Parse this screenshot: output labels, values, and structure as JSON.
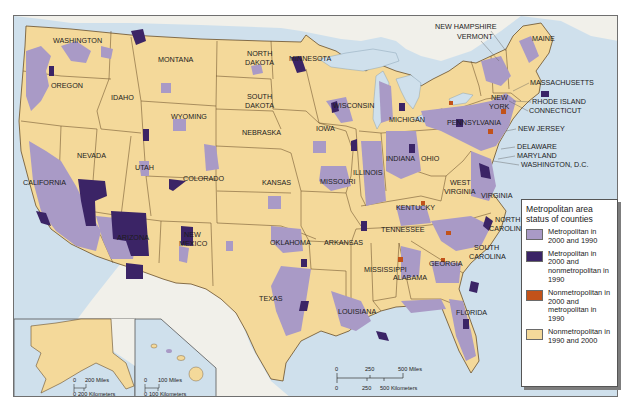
{
  "map": {
    "title": "Metropolitan area status of counties, United States, 1990 and 2000",
    "colors": {
      "water": "#cfe0ec",
      "foreign_land": "#f1f0ea",
      "nonmetro": "#f4d99a",
      "metro_both": "#a99ac6",
      "metro_new": "#3b2466",
      "nonmetro_new": "#c2521a",
      "border": "#6a4f2a"
    },
    "state_labels": [
      {
        "name": "WASHINGTON",
        "x": 52,
        "y": 42
      },
      {
        "name": "OREGON",
        "x": 50,
        "y": 87
      },
      {
        "name": "CALIFORNIA",
        "x": 22,
        "y": 184
      },
      {
        "name": "NEVADA",
        "x": 76,
        "y": 157
      },
      {
        "name": "IDAHO",
        "x": 110,
        "y": 99
      },
      {
        "name": "MONTANA",
        "x": 157,
        "y": 61
      },
      {
        "name": "WYOMING",
        "x": 170,
        "y": 118
      },
      {
        "name": "UTAH",
        "x": 134,
        "y": 169
      },
      {
        "name": "COLORADO",
        "x": 182,
        "y": 180
      },
      {
        "name": "ARIZONA",
        "x": 116,
        "y": 239
      },
      {
        "name": "NEW",
        "x": 183,
        "y": 236
      },
      {
        "name": "MEXICO",
        "x": 178,
        "y": 245
      },
      {
        "name": "NORTH",
        "x": 246,
        "y": 55
      },
      {
        "name": "DAKOTA",
        "x": 244,
        "y": 64
      },
      {
        "name": "SOUTH",
        "x": 246,
        "y": 98
      },
      {
        "name": "DAKOTA",
        "x": 244,
        "y": 107
      },
      {
        "name": "NEBRASKA",
        "x": 241,
        "y": 134
      },
      {
        "name": "KANSAS",
        "x": 261,
        "y": 184
      },
      {
        "name": "OKLAHOMA",
        "x": 269,
        "y": 244
      },
      {
        "name": "TEXAS",
        "x": 258,
        "y": 300
      },
      {
        "name": "MINNESOTA",
        "x": 288,
        "y": 60
      },
      {
        "name": "IOWA",
        "x": 315,
        "y": 130
      },
      {
        "name": "MISSOURI",
        "x": 319,
        "y": 183
      },
      {
        "name": "ARKANSAS",
        "x": 323,
        "y": 244
      },
      {
        "name": "LOUISIANA",
        "x": 337,
        "y": 313
      },
      {
        "name": "WISCONSIN",
        "x": 332,
        "y": 107
      },
      {
        "name": "ILLINOIS",
        "x": 352,
        "y": 174
      },
      {
        "name": "MICHIGAN",
        "x": 388,
        "y": 121
      },
      {
        "name": "INDIANA",
        "x": 385,
        "y": 160
      },
      {
        "name": "OHIO",
        "x": 420,
        "y": 160
      },
      {
        "name": "KENTUCKY",
        "x": 395,
        "y": 209
      },
      {
        "name": "TENNESSEE",
        "x": 380,
        "y": 231
      },
      {
        "name": "MISSISSIPPI",
        "x": 363,
        "y": 271
      },
      {
        "name": "ALABAMA",
        "x": 392,
        "y": 279
      },
      {
        "name": "GEORGIA",
        "x": 428,
        "y": 265
      },
      {
        "name": "FLORIDA",
        "x": 455,
        "y": 314
      },
      {
        "name": "WEST",
        "x": 449,
        "y": 184
      },
      {
        "name": "VIRGINIA",
        "x": 443,
        "y": 193
      },
      {
        "name": "VIRGINIA",
        "x": 480,
        "y": 197
      },
      {
        "name": "NORTH",
        "x": 494,
        "y": 221
      },
      {
        "name": "CAROLINA",
        "x": 488,
        "y": 230
      },
      {
        "name": "SOUTH",
        "x": 473,
        "y": 249
      },
      {
        "name": "CAROLINA",
        "x": 468,
        "y": 258
      },
      {
        "name": "PENNSYLVANIA",
        "x": 446,
        "y": 124
      },
      {
        "name": "NEW",
        "x": 490,
        "y": 99
      },
      {
        "name": "YORK",
        "x": 488,
        "y": 108
      },
      {
        "name": "MAINE",
        "x": 531,
        "y": 40
      },
      {
        "name": "ALASKA",
        "x": 44,
        "y": 325
      },
      {
        "name": "HAWAII",
        "x": 131,
        "y": 351
      }
    ],
    "callout_labels": [
      {
        "name": "NEW HAMPSHIRE",
        "x": 434,
        "y": 28
      },
      {
        "name": "VERMONT",
        "x": 456,
        "y": 38
      },
      {
        "name": "MASSACHUSETTS",
        "x": 529,
        "y": 84
      },
      {
        "name": "RHODE ISLAND",
        "x": 531,
        "y": 103
      },
      {
        "name": "CONNECTICUT",
        "x": 528,
        "y": 112
      },
      {
        "name": "NEW JERSEY",
        "x": 517,
        "y": 130
      },
      {
        "name": "DELAWARE",
        "x": 516,
        "y": 148
      },
      {
        "name": "MARYLAND",
        "x": 516,
        "y": 157
      },
      {
        "name": "WASHINGTON, D.C.",
        "x": 520,
        "y": 166
      }
    ],
    "scale_main": {
      "miles_ticks": [
        "0",
        "250",
        "500 Miles"
      ],
      "km_ticks": [
        "0",
        "250",
        "500 Kilometers"
      ]
    },
    "scale_alaska": {
      "miles_ticks": [
        "0",
        "200 Miles"
      ],
      "km_ticks": [
        "0",
        "200 Kilometers"
      ]
    },
    "scale_hawaii": {
      "miles_ticks": [
        "0",
        "100 Miles"
      ],
      "km_ticks": [
        "0",
        "100 Kilometers"
      ]
    }
  },
  "legend": {
    "title": "Metropolitan area status of counties",
    "items": [
      {
        "label": "Metropolitan in 2000 and 1990",
        "color": "#a99ac6"
      },
      {
        "label": "Metropolitan in 2000 and nonmetropolitan in 1990",
        "color": "#3b2466"
      },
      {
        "label": "Nonmetropolitan in 2000 and metropolitan in 1990",
        "color": "#c2521a"
      },
      {
        "label": "Nonmetropolitan in 1990 and 2000",
        "color": "#f4d99a"
      }
    ]
  },
  "caption": "Figure caption text (faint, partially cut off)"
}
